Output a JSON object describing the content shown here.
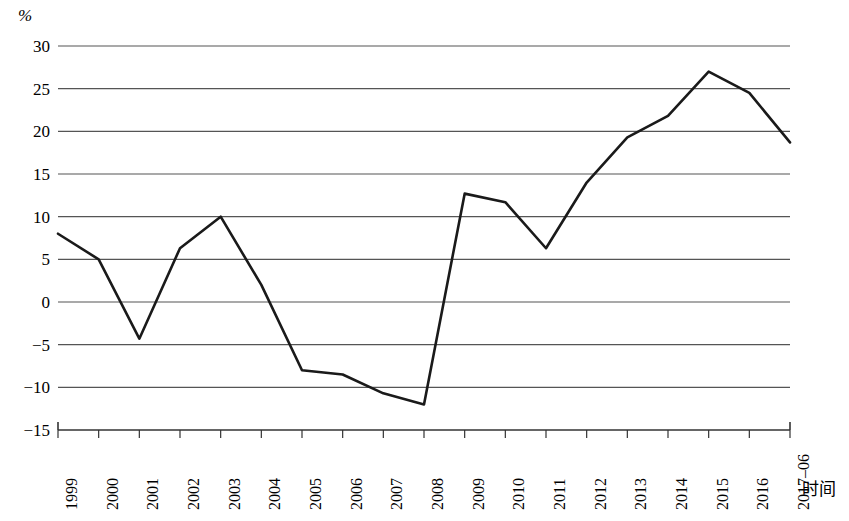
{
  "chart_data": {
    "type": "line",
    "title": "",
    "subtitle": "",
    "xlabel": "时间",
    "ylabel": "%",
    "unit_label": "%",
    "categories": [
      "1999",
      "2000",
      "2001",
      "2002",
      "2003",
      "2004",
      "2005",
      "2006",
      "2007",
      "2008",
      "2009",
      "2010",
      "2011",
      "2012",
      "2013",
      "2014",
      "2015",
      "2016",
      "2017–06"
    ],
    "values": [
      8.0,
      5.0,
      -4.3,
      6.3,
      10.0,
      2.0,
      -8.0,
      -8.5,
      -10.7,
      -12.0,
      12.7,
      11.7,
      6.3,
      14.0,
      19.3,
      21.8,
      27.0,
      24.5,
      18.7
    ],
    "series": [
      {
        "name": "",
        "values": [
          8.0,
          5.0,
          -4.3,
          6.3,
          10.0,
          2.0,
          -8.0,
          -8.5,
          -10.7,
          -12.0,
          12.7,
          11.7,
          6.3,
          14.0,
          19.3,
          21.8,
          27.0,
          24.5,
          18.7
        ]
      }
    ],
    "ylim": [
      -15,
      30
    ],
    "ytick_labels": [
      "30",
      "25",
      "20",
      "15",
      "10",
      "5",
      "0",
      "−5",
      "−10",
      "−15"
    ],
    "ytick_values": [
      30,
      25,
      20,
      15,
      10,
      5,
      0,
      -5,
      -10,
      -15
    ],
    "ytick_step": 5,
    "grid": true,
    "grid_axis": "y",
    "legend": false,
    "legend_position": "none",
    "line_color": "#1a1a1a",
    "grid_color": "#555555",
    "axis_color": "#333333",
    "background_color": "#ffffff",
    "markers": false
  }
}
